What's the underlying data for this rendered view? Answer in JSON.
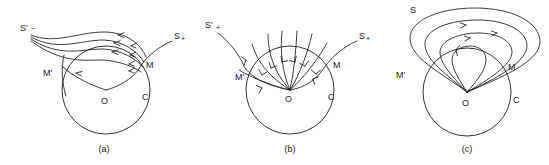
{
  "figure": {
    "background_color": "#ffffff",
    "line_color": "#1a1a1a",
    "width": 549,
    "height": 165
  },
  "panels": [
    {
      "id": "a",
      "caption": "(a)",
      "labels": {
        "separatrix_left": "S'",
        "separatrix_left_sign": "−",
        "separatrix_right": "S",
        "separatrix_right_sign": "+",
        "point_m_prime": "M'",
        "point_m": "M",
        "origin": "O",
        "circle": "C"
      },
      "trajectory_count": 4,
      "flow_direction": "inward-from-right"
    },
    {
      "id": "b",
      "caption": "(b)",
      "labels": {
        "separatrix_left": "S'",
        "separatrix_left_sign": "+",
        "separatrix_right": "S",
        "separatrix_right_sign": "+",
        "point_m_prime": "M'",
        "point_m": "M",
        "origin": "O",
        "circle": "C"
      },
      "trajectory_count": 7,
      "flow_direction": "radially-inward"
    },
    {
      "id": "c",
      "caption": "(c)",
      "labels": {
        "separatrix_top": "S",
        "point_m_prime": "M'",
        "point_m": "M",
        "origin": "O",
        "circle": "C"
      },
      "trajectory_count": 4,
      "flow_direction": "closed-loops-counterclockwise"
    }
  ]
}
